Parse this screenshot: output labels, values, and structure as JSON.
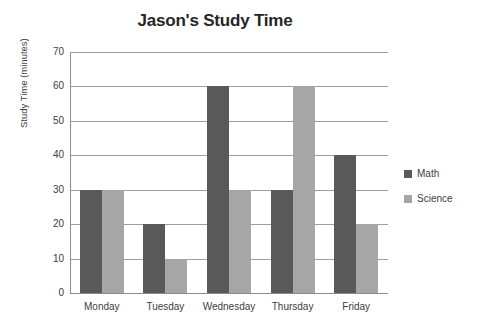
{
  "chart_data": {
    "type": "bar",
    "title": "Jason's Study Time",
    "xlabel": "",
    "ylabel": "Study Time (minutes)",
    "categories": [
      "Monday",
      "Tuesday",
      "Wednesday",
      "Thursday",
      "Friday"
    ],
    "series": [
      {
        "name": "Math",
        "color": "#595959",
        "values": [
          30,
          20,
          60,
          30,
          40
        ]
      },
      {
        "name": "Science",
        "color": "#a6a6a6",
        "values": [
          30,
          10,
          30,
          60,
          20
        ]
      }
    ],
    "ylim": [
      0,
      70
    ],
    "ytick_step": 10,
    "ytick_labels": [
      "70",
      "60",
      "50",
      "40",
      "30",
      "20",
      "10",
      "0"
    ],
    "grid": true,
    "legend_position": "right",
    "plot_background": "#ffffff",
    "gridline_color": "#9e9e9e",
    "text_color": "#404040",
    "title_color": "#262626"
  }
}
